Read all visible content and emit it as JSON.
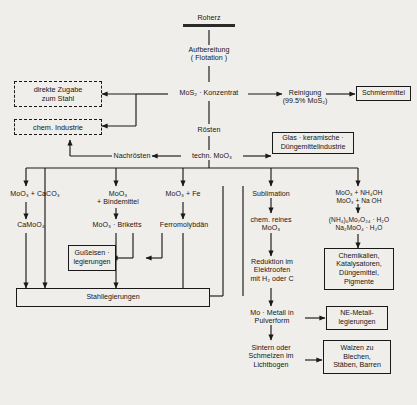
{
  "diagram": {
    "nodes": {
      "roherz": "Roherz",
      "aufbereitung": "Aufbereitung\n( Flotation )",
      "konzentrat": "MoS₂ · Konzentrat",
      "reinigung": "Reinigung\n(99.5% MoS₂)",
      "schmiermittel": "Schmiermittel",
      "direkte_zugabe": "direkte Zugabe\nzum Stahl",
      "chem_industrie": "chem. Industrie",
      "roesten": "Rösten",
      "nachroesten": "Nachrösten",
      "techn_moo3": "techn. MoO₃",
      "glas_keramik": "Glas · keramische ·\nDüngemittelindustrie",
      "col1_top": "MoO₃ + CaCO₃",
      "col1_mid": "CaMoO₄",
      "col2_top": "MoO₃\n+ Bindemittel",
      "col2_mid": "MoO₃ · Briketts",
      "col3_top": "MoO₃ + Fe",
      "col3_mid": "Ferromolybdän",
      "col4_top": "Sublimation",
      "col4_mid": "chem. reines\nMoO₃",
      "col5_top": "MoO₃ + NH₄OH\nMoO₃ + Na OH",
      "col5_mid": "(NH₄)₆Mo₇O₂₄ · H₂O\nNa₂MoO₄ · H₂O",
      "gusseisen": "Gußeisen ·\nlegierungen",
      "stahllegierungen": "Stahllegierungen",
      "reduktion": "Reduktion im\nElektroofen\nmit H₂ oder C",
      "chemikalien": "Chemikalien,\nKatalysatoren,\nDüngemittel,\nPigmente",
      "mo_metall": "Mo · Metall in\nPulverform",
      "ne_metall": "NE-Metall-\nlegierungen",
      "sintern": "Sintern oder\nSchmelzen im\nLichtbogen",
      "walzen": "Walzen zu\nBlechen,\nStäben, Barren"
    },
    "colors": {
      "background": "#f0eeea",
      "ink": "#191919",
      "text": "#161616"
    }
  }
}
